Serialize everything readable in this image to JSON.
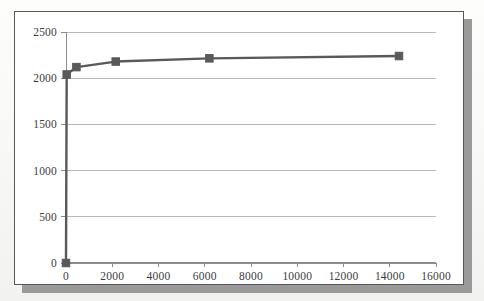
{
  "chart_data": {
    "type": "line",
    "title": "",
    "subtitle": "",
    "xlabel": "",
    "ylabel": "",
    "xlim": [
      0,
      16000
    ],
    "ylim": [
      0,
      2500
    ],
    "grid": "horizontal",
    "legend": "none",
    "marker": "square",
    "series_color": "#595959",
    "gridline_color": "#b9b9b9",
    "axis_color": "#8c8c8c",
    "xticks": [
      0,
      2000,
      4000,
      6000,
      8000,
      10000,
      12000,
      14000,
      16000
    ],
    "xtick_labels": [
      "0",
      "2000",
      "4000",
      "6000",
      "8000",
      "10000",
      "12000",
      "14000",
      "16000"
    ],
    "yticks": [
      0,
      500,
      1000,
      1500,
      2000,
      2500
    ],
    "ytick_labels": [
      "0",
      "500",
      "1000",
      "1500",
      "2000",
      "2500"
    ],
    "series": [
      {
        "name": "series-1",
        "x": [
          0,
          30,
          450,
          2150,
          6200,
          14400
        ],
        "values": [
          0,
          2040,
          2120,
          2180,
          2215,
          2240
        ]
      }
    ]
  },
  "frame": {
    "border_color": "#58585a",
    "shadow_color": "#9a9a9a",
    "background": "#ffffff"
  }
}
